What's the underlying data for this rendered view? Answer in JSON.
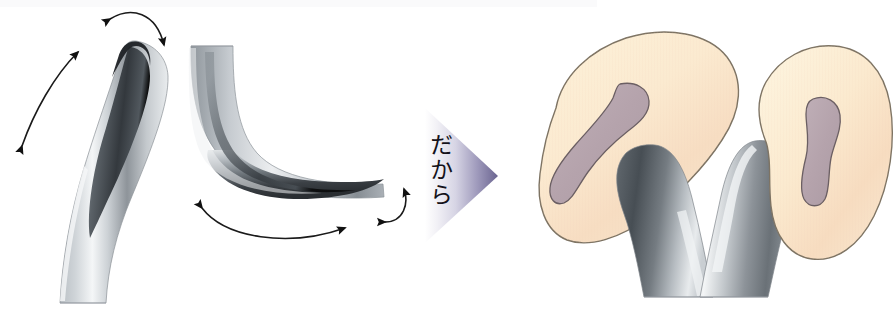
{
  "figure": {
    "domain": "anatomical-diagram",
    "title": "",
    "background_color": "#ffffff",
    "width": 895,
    "height": 325,
    "transition_label": "だから",
    "transition_label_meaning": "therefore / so",
    "panels": [
      {
        "id": "panel-left",
        "name": "curved-tube-upright",
        "description": "Upright curved metallic tube, rounded tip at top, with double-headed arc arrow on the left and a double-headed arc arrow over the tip",
        "arrow_count": 2
      },
      {
        "id": "panel-middle",
        "name": "curved-tube-bent",
        "description": "J / L shaped bent metallic tube with double-headed arc arrow below and a small double-headed arc arrow at right",
        "arrow_count": 2
      },
      {
        "id": "panel-right",
        "name": "kidney-pair-with-tubes",
        "description": "Two cream kidney shaped organs with mauve inner medulla, flanking two mirrored grey curved tubes",
        "organ_count": 2,
        "tube_count": 2
      }
    ]
  },
  "colors": {
    "background": "#ffffff",
    "metal_light": "#fdfdfd",
    "metal_mid": "#9aa0a6",
    "metal_dark": "#3a3f44",
    "metal_darkest": "#23272b",
    "outline": "#5a5f63",
    "organ_fill_light": "#fcf0d4",
    "organ_fill_warm": "#f7ddc2",
    "organ_outline": "#7d7363",
    "medulla_fill": "#b7a6ae",
    "medulla_outline": "#6b5f63",
    "arrow_stroke": "#1a1a1a",
    "transition_gradient_start": "#ffffff",
    "transition_gradient_end": "#6a6490",
    "transition_text": "#14121a",
    "top_band": "#fafafb"
  },
  "labels": {
    "transition_arrow_name": "therefore-arrow",
    "left_tube_name": "upright-curved-tube",
    "middle_tube_name": "bent-curved-tube",
    "organ_left_name": "kidney-left",
    "organ_right_name": "kidney-right",
    "tube_left_name": "ureter-tube-left",
    "tube_right_name": "ureter-tube-right"
  }
}
